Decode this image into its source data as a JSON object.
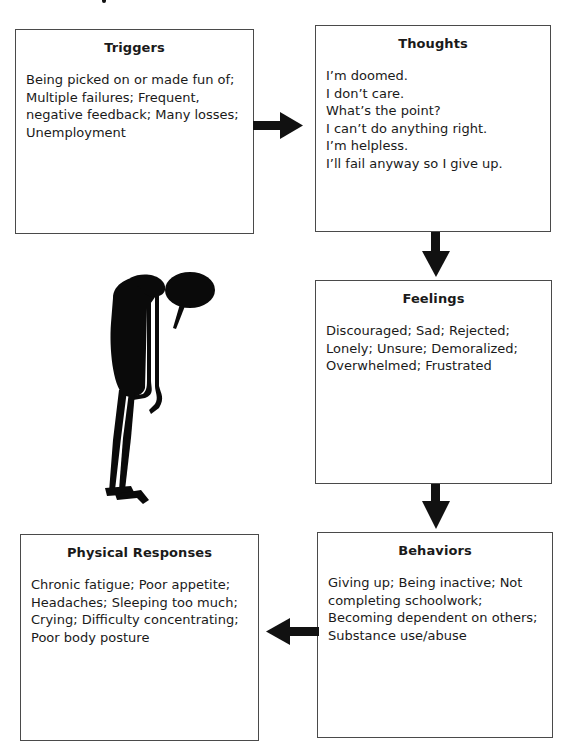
{
  "diagram": {
    "boxes": {
      "triggers": {
        "title": "Triggers",
        "lines": [
          "Being picked on or made fun of;",
          "Multiple failures; Frequent,",
          "negative feedback; Many losses;",
          "Unemployment"
        ]
      },
      "thoughts": {
        "title": "Thoughts",
        "lines": [
          "I’m doomed.",
          "I don’t care.",
          "What’s the point?",
          "I can’t do anything right.",
          "I’m helpless.",
          "I’ll fail anyway so I give up."
        ]
      },
      "feelings": {
        "title": "Feelings",
        "lines": [
          "Discouraged; Sad; Rejected;",
          "Lonely; Unsure; Demoralized;",
          "Overwhelmed; Frustrated"
        ]
      },
      "behaviors": {
        "title": "Behaviors",
        "lines": [
          "Giving up; Being inactive; Not",
          "completing schoolwork;",
          "Becoming dependent on others;",
          "Substance use/abuse"
        ]
      },
      "physical": {
        "title": "Physical Responses",
        "lines": [
          "Chronic fatigue; Poor appetite;",
          "Headaches; Sleeping too much;",
          "Crying; Difficulty concentrating;",
          "Poor body posture"
        ]
      }
    },
    "arrows": [
      {
        "from": "Triggers",
        "to": "Thoughts",
        "direction": "right"
      },
      {
        "from": "Thoughts",
        "to": "Feelings",
        "direction": "down"
      },
      {
        "from": "Feelings",
        "to": "Behaviors",
        "direction": "down"
      },
      {
        "from": "Behaviors",
        "to": "Physical Responses",
        "direction": "left"
      }
    ],
    "illustration": "slumped-figure-with-speech-bubble",
    "colors": {
      "border": "#4a4a4a",
      "arrow": "#111111",
      "text": "#1a1a1a",
      "background": "#ffffff"
    }
  }
}
